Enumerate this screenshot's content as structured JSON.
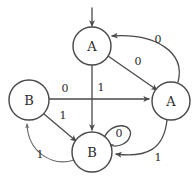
{
  "diagram": {
    "type": "finite-state-machine",
    "colors": {
      "background": "#ffffff",
      "node_stroke": "#4a4a4a",
      "node_fill": "#ffffff",
      "edge_stroke": "#4a4a4a",
      "text": "#2b2b2b"
    },
    "nodes": [
      {
        "id": "a_top",
        "label": "A",
        "cx": 92,
        "cy": 46,
        "r": 19
      },
      {
        "id": "b_left",
        "label": "B",
        "cx": 29,
        "cy": 100,
        "r": 20
      },
      {
        "id": "a_right",
        "label": "A",
        "cx": 171,
        "cy": 101,
        "r": 19
      },
      {
        "id": "b_bottom",
        "label": "B",
        "cx": 92,
        "cy": 152,
        "r": 20
      }
    ],
    "start_marker": {
      "target": "a_top",
      "label": ""
    },
    "edges": [
      {
        "id": "e1",
        "from": "a_top",
        "to": "a_right",
        "label": "0",
        "shape": "straight"
      },
      {
        "id": "e2",
        "from": "a_right",
        "to": "a_top",
        "label": "0",
        "shape": "curve-outer"
      },
      {
        "id": "e3",
        "from": "b_left",
        "to": "a_right",
        "label": "0",
        "shape": "straight"
      },
      {
        "id": "e4",
        "from": "a_top",
        "to": "b_bottom",
        "label": "1",
        "shape": "straight"
      },
      {
        "id": "e5",
        "from": "b_left",
        "to": "b_bottom",
        "label": "1",
        "shape": "straight"
      },
      {
        "id": "e6",
        "from": "b_bottom",
        "to": "b_left",
        "label": "1",
        "shape": "curve-under"
      },
      {
        "id": "e7",
        "from": "a_right",
        "to": "b_bottom",
        "label": "1",
        "shape": "curve-under"
      },
      {
        "id": "e8",
        "from": "b_bottom",
        "to": "b_bottom",
        "label": "0",
        "shape": "self-loop"
      }
    ],
    "edge_labels": {
      "a_top_to_a_right": "0",
      "a_right_to_a_top": "0",
      "b_left_to_a_right": "0",
      "a_top_to_b_bottom": "1",
      "b_left_to_b_bottom": "1",
      "b_bottom_to_b_left": "1",
      "a_right_to_b_bottom": "1",
      "b_bottom_self": "0"
    },
    "node_labels": {
      "a_top": "A",
      "b_left": "B",
      "a_right": "A",
      "b_bottom": "B"
    }
  }
}
